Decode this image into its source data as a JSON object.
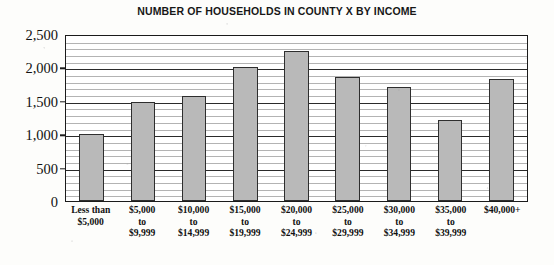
{
  "chart_data": {
    "type": "bar",
    "title": "NUMBER OF HOUSEHOLDS IN COUNTY X BY INCOME",
    "xlabel": "",
    "ylabel": "",
    "ylim": [
      0,
      2500
    ],
    "y_major_ticks": [
      0,
      500,
      1000,
      1500,
      2000,
      2500
    ],
    "y_tick_labels": [
      "0",
      "500",
      "1,000",
      "1,500",
      "2,000",
      "2,500"
    ],
    "y_minor_interval": 100,
    "grid": true,
    "legend": false,
    "bar_fill_color": "#b9b9b9",
    "bar_edge_color": "#2e2e2e",
    "categories": [
      "Less than\n$5,000",
      "$5,000\nto\n$9,999",
      "$10,000\nto\n$14,999",
      "$15,000\nto\n$19,999",
      "$20,000\nto\n$24,999",
      "$25,000\nto\n$29,999",
      "$30,000\nto\n$34,999",
      "$35,000\nto\n$39,999",
      "$40,000+"
    ],
    "values": [
      1000,
      1480,
      1570,
      2000,
      2250,
      1860,
      1710,
      1220,
      1820
    ]
  }
}
